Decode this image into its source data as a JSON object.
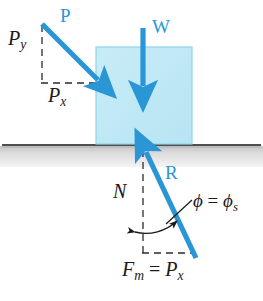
{
  "figure": {
    "colors": {
      "vector_blue": "#2a96d6",
      "block_fill": "#bfe8f5",
      "block_edge": "#8fd4ea",
      "ground_line": "#555555",
      "ground_fill": "#d9d9d9",
      "label_black": "#1a1a1a"
    }
  },
  "labels": {
    "applied_force": "P",
    "weight": "W",
    "reaction": "R",
    "p_vertical_component": "P",
    "p_vertical_component_sub": "y",
    "p_horizontal_component": "P",
    "p_horizontal_component_sub": "x",
    "normal_force": "N",
    "friction_max": "F",
    "friction_max_sub": "m",
    "friction_equals": " = ",
    "friction_rhs": "P",
    "friction_rhs_sub": "x",
    "angle_phi": "ϕ",
    "angle_equals": " = ",
    "angle_phi_s": "ϕ",
    "angle_phi_s_sub": "s"
  },
  "elements": {
    "block": {
      "name": "block",
      "x": 96,
      "y": 47,
      "width": 96,
      "height": 97
    },
    "ground": {
      "name": "ground-surface",
      "y": 144,
      "thickness": 2,
      "band_height": 21
    },
    "vector_P": {
      "from": [
        42,
        24
      ],
      "to": [
        101,
        83
      ]
    },
    "vector_W": {
      "from": [
        143,
        28
      ],
      "to": [
        143,
        92
      ]
    },
    "vector_R": {
      "from": [
        196,
        258
      ],
      "to": [
        143,
        147
      ]
    },
    "dashed_Py": {
      "from": [
        42,
        24
      ],
      "to": [
        42,
        83
      ]
    },
    "dashed_Px": {
      "from": [
        42,
        83
      ],
      "to": [
        99,
        83
      ]
    },
    "dashed_N": {
      "from": [
        143,
        150
      ],
      "to": [
        143,
        253
      ]
    },
    "dashed_Fm": {
      "from": [
        143,
        253
      ],
      "to": [
        194,
        253
      ]
    },
    "angle_arc": {
      "center": [
        143,
        253
      ],
      "radius": 52
    }
  }
}
